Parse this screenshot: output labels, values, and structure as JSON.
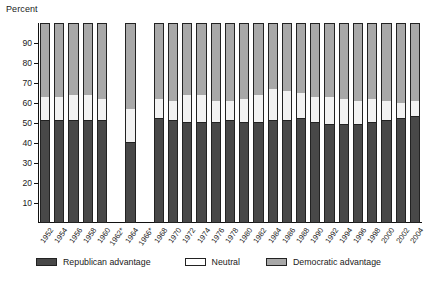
{
  "chart_data": {
    "type": "bar",
    "subtype": "stacked-100-percent",
    "title": "",
    "ylabel": "Percent",
    "xlabel": "",
    "ylim": [
      0,
      100
    ],
    "yticks": [
      10,
      20,
      30,
      40,
      50,
      60,
      70,
      80,
      90
    ],
    "grid": false,
    "legend_position": "bottom",
    "categories": [
      "1952",
      "1954",
      "1956",
      "1958",
      "1960",
      "1962*",
      "1964",
      "1966*",
      "1968",
      "1970",
      "1972",
      "1974",
      "1976",
      "1978",
      "1980",
      "1982",
      "1984",
      "1986",
      "1988",
      "1990",
      "1992",
      "1994",
      "1996",
      "1998",
      "2000",
      "2002",
      "2004"
    ],
    "series": [
      {
        "name": "Republican advantage",
        "color": "#484848",
        "values": [
          51,
          51,
          51,
          51,
          51,
          null,
          40,
          null,
          52,
          51,
          50,
          50,
          50,
          51,
          50,
          50,
          51,
          51,
          52,
          50,
          49,
          49,
          49,
          50,
          51,
          52,
          53
        ]
      },
      {
        "name": "Neutral",
        "color": "#ffffff",
        "values": [
          12,
          12,
          13,
          13,
          11,
          null,
          17,
          null,
          10,
          10,
          14,
          14,
          11,
          10,
          12,
          14,
          16,
          15,
          13,
          13,
          14,
          13,
          12,
          12,
          10,
          8,
          8
        ]
      },
      {
        "name": "Democratic advantage",
        "color": "#a8a8a8",
        "values": [
          37,
          37,
          36,
          36,
          38,
          null,
          43,
          null,
          38,
          39,
          36,
          36,
          39,
          39,
          38,
          36,
          33,
          34,
          35,
          37,
          37,
          38,
          39,
          38,
          39,
          40,
          39
        ]
      }
    ],
    "missing_categories": [
      "1962*",
      "1966*"
    ]
  },
  "legend": {
    "items": [
      {
        "label": "Republican advantage",
        "swatch": "rep"
      },
      {
        "label": "Neutral",
        "swatch": "neu"
      },
      {
        "label": "Democratic advantage",
        "swatch": "dem"
      }
    ]
  },
  "colors": {
    "republican": "#484848",
    "neutral": "#ffffff",
    "democratic": "#a8a8a8",
    "axis": "#111111"
  }
}
